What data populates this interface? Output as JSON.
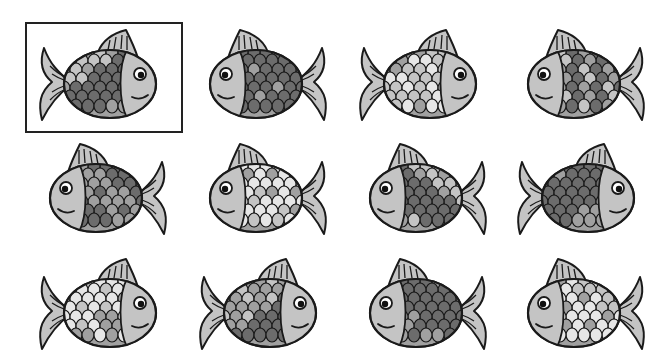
{
  "puzzle": {
    "reference_index": 0,
    "colors": {
      "outline": "#1a1a1a",
      "head": "#c4c4c4",
      "fin": "#c4c4c4",
      "scale_light": "#e6e6e6",
      "scale_mid": "#a0a0a0",
      "scale_dark": "#6c6c6c",
      "eye_white": "#ffffff",
      "pupil": "#111111"
    },
    "fish": [
      {
        "row": 0,
        "col": 0,
        "facing": "right",
        "pattern": "mixed",
        "framed": true
      },
      {
        "row": 0,
        "col": 1,
        "facing": "left",
        "pattern": "dark",
        "framed": false
      },
      {
        "row": 0,
        "col": 2,
        "facing": "right",
        "pattern": "light",
        "framed": false
      },
      {
        "row": 0,
        "col": 3,
        "facing": "left",
        "pattern": "mixed",
        "framed": false
      },
      {
        "row": 1,
        "col": 0,
        "facing": "left",
        "pattern": "dark",
        "framed": false
      },
      {
        "row": 1,
        "col": 1,
        "facing": "left",
        "pattern": "light",
        "framed": false
      },
      {
        "row": 1,
        "col": 2,
        "facing": "left",
        "pattern": "mixed",
        "framed": false
      },
      {
        "row": 1,
        "col": 3,
        "facing": "right",
        "pattern": "dark",
        "framed": false
      },
      {
        "row": 2,
        "col": 0,
        "facing": "right",
        "pattern": "light",
        "framed": false
      },
      {
        "row": 2,
        "col": 1,
        "facing": "right",
        "pattern": "mixed",
        "framed": false
      },
      {
        "row": 2,
        "col": 2,
        "facing": "left",
        "pattern": "dark",
        "framed": false
      },
      {
        "row": 2,
        "col": 3,
        "facing": "left",
        "pattern": "light",
        "framed": false
      }
    ],
    "layout": {
      "col_x": [
        28,
        188,
        348,
        506
      ],
      "row_y": [
        24,
        138,
        253
      ]
    }
  }
}
